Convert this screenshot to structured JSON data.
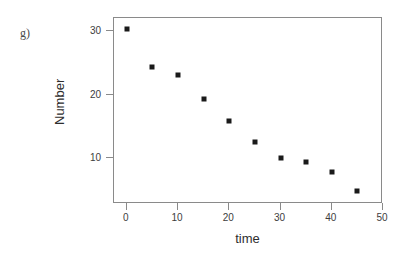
{
  "panel": {
    "letter": "g)"
  },
  "chart_data": {
    "type": "scatter",
    "title": "",
    "xlabel": "time",
    "ylabel": "Number",
    "xlim": [
      -2.5,
      50
    ],
    "ylim": [
      2.8,
      32.1
    ],
    "grid": false,
    "legend": null,
    "xticks": [
      0,
      10,
      20,
      30,
      40,
      50
    ],
    "xtick_labels": [
      "0",
      "10",
      "20",
      "30",
      "40",
      "50"
    ],
    "yticks": [
      10,
      20,
      30
    ],
    "ytick_labels": [
      "10",
      "20",
      "30"
    ],
    "marker": {
      "shape": "square",
      "color": "#1a1a1a",
      "size": 5
    },
    "series": [
      {
        "name": "Number",
        "x": [
          0,
          5,
          10,
          15,
          20,
          25,
          30,
          35,
          40,
          45
        ],
        "y": [
          30.4,
          24.4,
          23.1,
          19.3,
          15.8,
          12.6,
          10.1,
          9.4,
          7.8,
          4.9
        ]
      }
    ]
  },
  "colors": {
    "frame": "#8a8a8a",
    "marker": "#1a1a1a",
    "text": "#2e2e2e",
    "background": "#ffffff"
  }
}
